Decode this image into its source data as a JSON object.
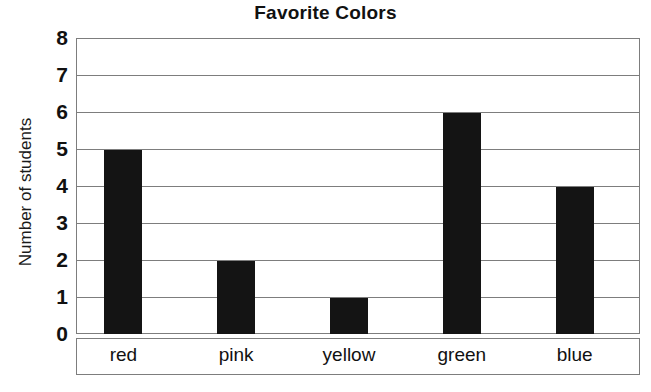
{
  "chart_data": {
    "type": "bar",
    "title": "Favorite Colors",
    "xlabel": "",
    "ylabel": "Number of students",
    "categories": [
      "red",
      "pink",
      "yellow",
      "green",
      "blue"
    ],
    "values": [
      5,
      2,
      1,
      6,
      4
    ],
    "ylim": [
      0,
      8
    ],
    "ytick_labels": [
      "8",
      "7",
      "6",
      "5",
      "4",
      "3",
      "2",
      "1",
      "0"
    ],
    "ytick_values": [
      8,
      7,
      6,
      5,
      4,
      3,
      2,
      1,
      0
    ],
    "grid": true,
    "legend": false,
    "bar_color": "#141414",
    "grid_color": "#7d7d7d",
    "background_color": "#ffffff"
  }
}
